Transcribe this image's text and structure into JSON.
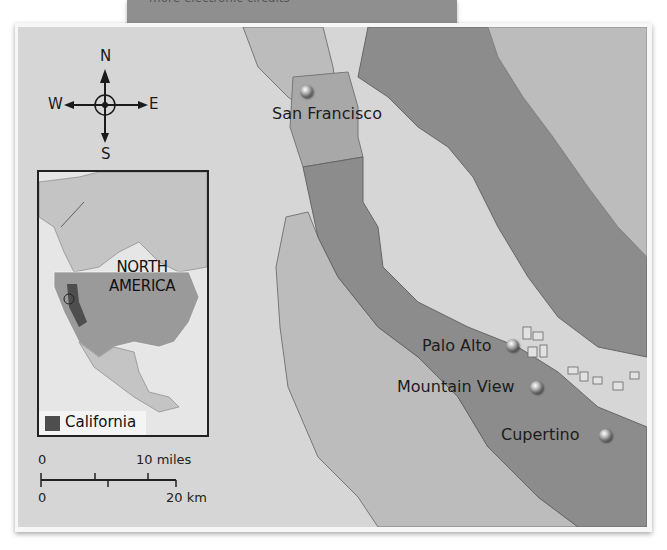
{
  "top_caption": {
    "text": "more electronic circuits"
  },
  "map": {
    "compass": {
      "north": "N",
      "south": "S",
      "east": "E",
      "west": "W"
    },
    "cities": [
      {
        "name": "San Francisco",
        "label_side": "below"
      },
      {
        "name": "Palo Alto",
        "label_side": "left"
      },
      {
        "name": "Mountain View",
        "label_side": "left"
      },
      {
        "name": "Cupertino",
        "label_side": "left"
      }
    ],
    "inset": {
      "region_label_line1": "NORTH",
      "region_label_line2": "AMERICA",
      "legend_label": "California",
      "legend_color": "#4e4e4e"
    },
    "scale_bar": {
      "miles_start": "0",
      "miles_end": "10 miles",
      "km_start": "0",
      "km_end": "20 km"
    },
    "colors": {
      "water": "#d6d6d6",
      "light_land": "#bcbcbc",
      "dark_land": "#8c8c8c",
      "city_region": "#a8a8a8",
      "frame": "#f7f7f7"
    }
  }
}
